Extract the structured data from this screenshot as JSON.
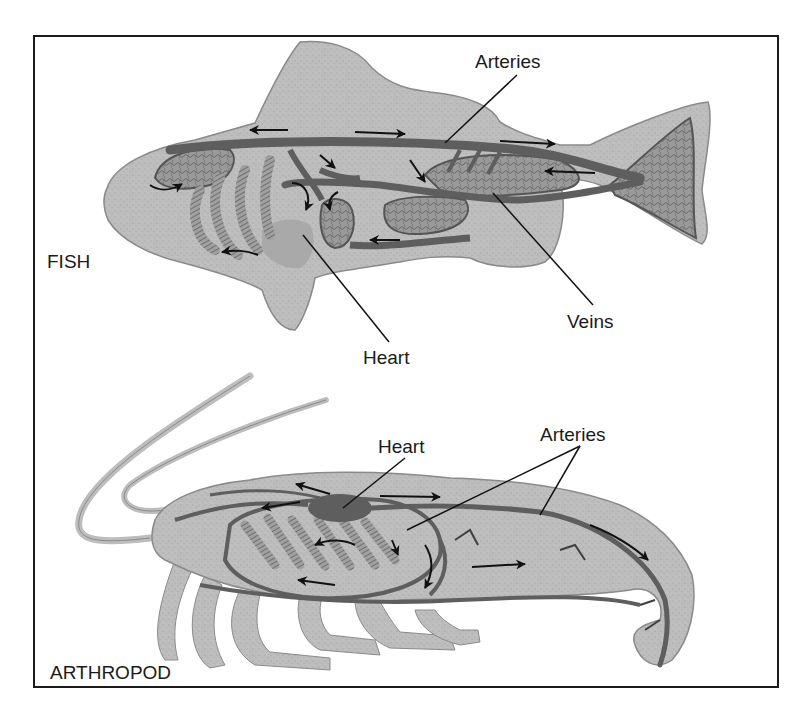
{
  "diagram": {
    "colors": {
      "body_fill": "#bdbdbd",
      "body_edge": "#8a8a8a",
      "vessel": "#5e5e5e",
      "organ": "#8e8e8e",
      "heart_fish": "#a9a9a9",
      "ink": "#1a1a1a",
      "frame": "#1a1a1a"
    },
    "fish": {
      "name_label": "FISH",
      "labels": {
        "arteries": "Arteries",
        "veins": "Veins",
        "heart": "Heart"
      }
    },
    "arthropod": {
      "name_label": "ARTHROPOD",
      "labels": {
        "heart": "Heart",
        "arteries": "Arteries"
      }
    }
  }
}
